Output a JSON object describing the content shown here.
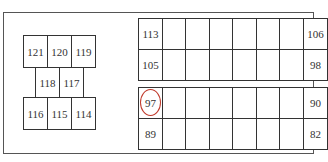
{
  "diagram": {
    "type": "fuse-box-layout",
    "highlight_color": "#c0392b",
    "left_cluster": {
      "top_row": [
        "121",
        "120",
        "119"
      ],
      "middle_row": [
        "118",
        "117"
      ],
      "bottom_row": [
        "116",
        "115",
        "114"
      ]
    },
    "right_grid_top": {
      "rows": [
        {
          "left": "113",
          "right": "106"
        },
        {
          "left": "105",
          "right": "98"
        }
      ],
      "columns": 8
    },
    "right_grid_bottom": {
      "rows": [
        {
          "left": "97",
          "right": "90"
        },
        {
          "left": "89",
          "right": "82"
        }
      ],
      "columns": 8
    },
    "highlighted": "97"
  }
}
